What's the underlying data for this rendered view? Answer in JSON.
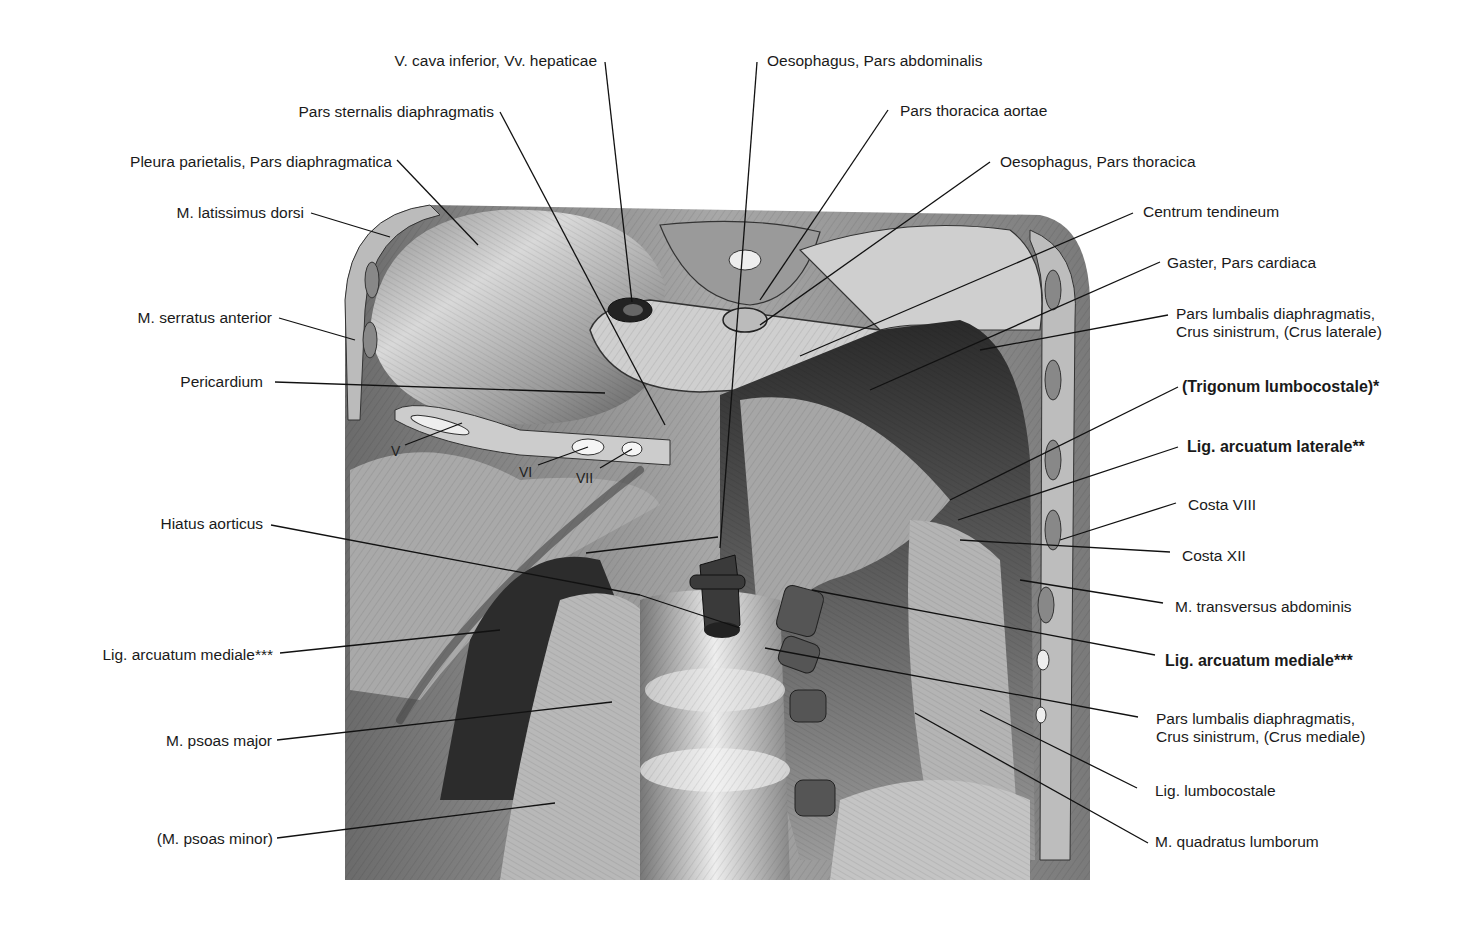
{
  "figure": {
    "labels_left": [
      {
        "id": "vcava",
        "text": "V. cava inferior, Vv. hepaticae"
      },
      {
        "id": "sternalis",
        "text": "Pars sternalis diaphragmatis"
      },
      {
        "id": "pleura",
        "text": "Pleura parietalis, Pars diaphragmatica"
      },
      {
        "id": "latissimus",
        "text": "M. latissimus dorsi"
      },
      {
        "id": "serratus",
        "text": "M. serratus anterior"
      },
      {
        "id": "pericardium",
        "text": "Pericardium"
      },
      {
        "id": "hiatus",
        "text": "Hiatus aorticus"
      },
      {
        "id": "arcmed_l",
        "text": "Lig. arcuatum mediale***"
      },
      {
        "id": "psoasmaj",
        "text": "M. psoas major"
      },
      {
        "id": "psoasmin",
        "text": "(M. psoas minor)"
      }
    ],
    "labels_right": [
      {
        "id": "oesabd",
        "text": "Oesophagus, Pars abdominalis"
      },
      {
        "id": "aorta",
        "text": "Pars thoracica aortae"
      },
      {
        "id": "oesthor",
        "text": "Oesophagus, Pars thoracica"
      },
      {
        "id": "centrum",
        "text": "Centrum tendineum"
      },
      {
        "id": "gaster",
        "text": "Gaster, Pars cardiaca"
      },
      {
        "id": "crus_lat_1",
        "text": "Pars lumbalis diaphragmatis,"
      },
      {
        "id": "crus_lat_2",
        "text": "Crus sinistrum, (Crus laterale)"
      },
      {
        "id": "trigonum",
        "text": "(Trigonum lumbocostale)*"
      },
      {
        "id": "arclat",
        "text": "Lig. arcuatum laterale**"
      },
      {
        "id": "costa8",
        "text": "Costa VIII"
      },
      {
        "id": "costa12",
        "text": "Costa XII"
      },
      {
        "id": "transversus",
        "text": "M. transversus abdominis"
      },
      {
        "id": "arcmed_r",
        "text": "Lig. arcuatum mediale***"
      },
      {
        "id": "crus_med_1",
        "text": "Pars lumbalis diaphragmatis,"
      },
      {
        "id": "crus_med_2",
        "text": "Crus sinistrum, (Crus mediale)"
      },
      {
        "id": "lumbocostale",
        "text": "Lig. lumbocostale"
      },
      {
        "id": "quadratus",
        "text": "M. quadratus lumborum"
      }
    ],
    "rib_numbers": [
      "V",
      "VI",
      "VII"
    ],
    "colors": {
      "background": "#ffffff",
      "line": "#111111",
      "text": "#1a1a1a"
    }
  }
}
